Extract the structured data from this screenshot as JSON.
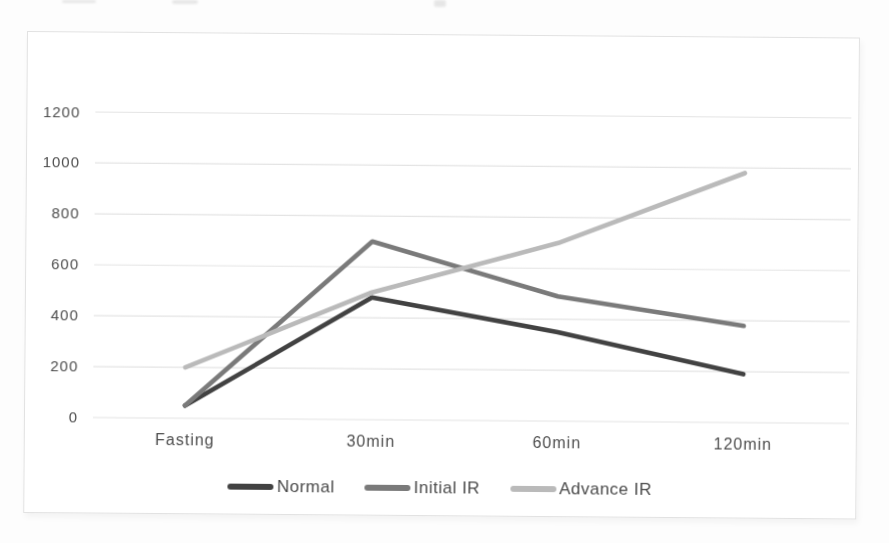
{
  "chart_data": {
    "type": "line",
    "title": "",
    "xlabel": "",
    "ylabel": "",
    "categories": [
      "Fasting",
      "30min",
      "60min",
      "120min"
    ],
    "series": [
      {
        "name": "Normal",
        "color": "#424242",
        "values": [
          50,
          480,
          350,
          190
        ]
      },
      {
        "name": "Initial IR",
        "color": "#7a7a7a",
        "values": [
          50,
          700,
          490,
          380
        ]
      },
      {
        "name": "Advance IR",
        "color": "#bababa",
        "values": [
          200,
          500,
          700,
          980
        ]
      }
    ],
    "ylim": [
      0,
      1200
    ],
    "y_ticks": [
      0,
      200,
      400,
      600,
      800,
      1000,
      1200
    ],
    "grid": true,
    "legend_position": "bottom-center",
    "plot_bg_color": "#ffffff",
    "grid_color": "#e4e4e4",
    "axis_text_color": "#4d4d4d"
  }
}
